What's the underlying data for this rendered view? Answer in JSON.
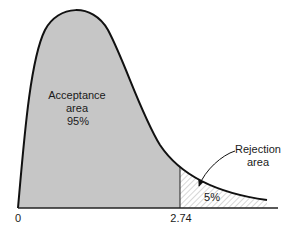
{
  "chart_data": {
    "type": "area",
    "title": "",
    "xlabel": "",
    "ylabel": "",
    "x_ticks": [
      {
        "value": 0,
        "label": "0"
      },
      {
        "value": 2.74,
        "label": "2.74"
      }
    ],
    "critical_value": 2.74,
    "regions": [
      {
        "name": "acceptance",
        "label_lines": [
          "Acceptance",
          "area",
          "95%"
        ],
        "percent": 95,
        "fill": "#c6c6c6",
        "pattern": "solid"
      },
      {
        "name": "rejection",
        "label_lines": [
          "Rejection",
          "area"
        ],
        "inner_label": "5%",
        "percent": 5,
        "fill": "#ffffff",
        "pattern": "diagonal-hatch"
      }
    ],
    "curve_color": "#111111",
    "axis_color": "#222222",
    "grid": false,
    "legend": "none"
  }
}
